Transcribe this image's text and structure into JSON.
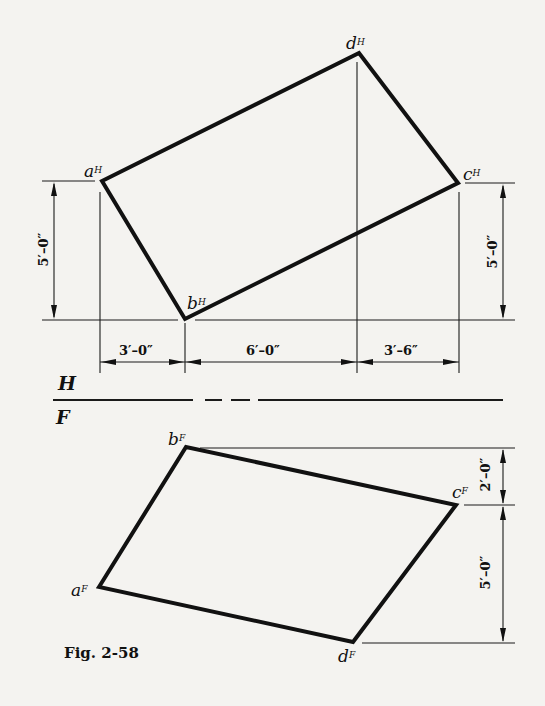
{
  "figure": {
    "caption": "Fig. 2-58",
    "planes": {
      "top": "H",
      "bottom": "F"
    }
  },
  "top_view": {
    "points": {
      "a": {
        "letter": "a",
        "sup": "H"
      },
      "b": {
        "letter": "b",
        "sup": "H"
      },
      "c": {
        "letter": "c",
        "sup": "H"
      },
      "d": {
        "letter": "d",
        "sup": "H"
      }
    },
    "dimensions": {
      "left_vertical": "5′–0″",
      "right_vertical": "5′–0″",
      "horizontal": [
        "3′–0″",
        "6′–0″",
        "3′–6″"
      ]
    }
  },
  "front_view": {
    "points": {
      "a": {
        "letter": "a",
        "sup": "F"
      },
      "b": {
        "letter": "b",
        "sup": "F"
      },
      "c": {
        "letter": "c",
        "sup": "F"
      },
      "d": {
        "letter": "d",
        "sup": "F"
      }
    },
    "dimensions": {
      "upper_vertical": "2′–0″",
      "lower_vertical": "5′–0″"
    }
  },
  "colors": {
    "ink": "#111111",
    "paper": "#f4f3f0"
  }
}
